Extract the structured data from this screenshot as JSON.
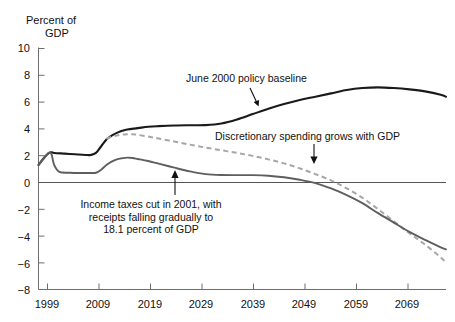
{
  "chart_data": {
    "type": "line",
    "title": "",
    "xlabel": "",
    "ylabel": "Percent of GDP",
    "ylabel_line1": "Percent of",
    "ylabel_line2": "GDP",
    "xlim": [
      1997,
      2075
    ],
    "ylim": [
      -8,
      10
    ],
    "grid": false,
    "legend": "none (inline annotations with arrows)",
    "ytick_labels": [
      "10",
      "8",
      "6",
      "4",
      "2",
      "0",
      "−2",
      "−4",
      "−6",
      "−8"
    ],
    "ytick_values": [
      10,
      8,
      6,
      4,
      2,
      0,
      -2,
      -4,
      -6,
      -8
    ],
    "xtick_labels": [
      "1999",
      "2009",
      "2019",
      "2029",
      "2039",
      "2049",
      "2059",
      "2069"
    ],
    "xtick_values": [
      1999,
      2009,
      2019,
      2029,
      2039,
      2049,
      2059,
      2069
    ],
    "zero_line": 0,
    "colors": {
      "baseline": "#1a1a1a",
      "tax_cut": "#5e5e5e",
      "discretionary": "#a6a6a6"
    },
    "series": [
      {
        "name": "June 2000 policy baseline",
        "style": "solid",
        "color": "#1a1a1a",
        "x": [
          1997,
          1998,
          1999,
          1999.6,
          2000,
          2002,
          2004,
          2006,
          2007,
          2008,
          2009,
          2010,
          2011,
          2012,
          2013,
          2014,
          2016,
          2018,
          2020,
          2023,
          2026,
          2029,
          2032,
          2035,
          2038,
          2041,
          2044,
          2047,
          2050,
          2053,
          2056,
          2059,
          2062,
          2065,
          2068,
          2071,
          2074,
          2075
        ],
        "y": [
          1.3,
          1.8,
          2.2,
          2.25,
          2.2,
          2.15,
          2.1,
          2.05,
          2.05,
          2.2,
          2.7,
          3.2,
          3.5,
          3.7,
          3.85,
          3.95,
          4.05,
          4.15,
          4.2,
          4.25,
          4.27,
          4.28,
          4.4,
          4.7,
          5.1,
          5.5,
          5.85,
          6.15,
          6.4,
          6.65,
          6.9,
          7.05,
          7.1,
          7.05,
          6.95,
          6.8,
          6.55,
          6.4
        ]
      },
      {
        "name": "Income taxes cut in 2001, with receipts falling gradually to 18.1 percent of GDP",
        "style": "solid",
        "color": "#5e5e5e",
        "x": [
          1997,
          1998,
          1999,
          1999.5,
          2000,
          2001,
          2003,
          2005,
          2007,
          2008,
          2009,
          2010,
          2011,
          2012,
          2013,
          2014,
          2015,
          2016,
          2018,
          2020,
          2023,
          2026,
          2029,
          2032,
          2035,
          2038,
          2041,
          2044,
          2047,
          2050,
          2053,
          2056,
          2059,
          2062,
          2065,
          2068,
          2071,
          2074,
          2075
        ],
        "y": [
          1.3,
          1.8,
          2.2,
          2.1,
          1.3,
          0.78,
          0.72,
          0.7,
          0.7,
          0.72,
          0.95,
          1.3,
          1.55,
          1.72,
          1.8,
          1.85,
          1.82,
          1.75,
          1.6,
          1.4,
          1.1,
          0.82,
          0.62,
          0.55,
          0.54,
          0.54,
          0.5,
          0.38,
          0.2,
          -0.05,
          -0.45,
          -0.95,
          -1.55,
          -2.3,
          -3.0,
          -3.7,
          -4.3,
          -4.85,
          -5.0
        ]
      },
      {
        "name": "Discretionary spending grows with GDP",
        "style": "dashed",
        "color": "#a6a6a6",
        "x": [
          2010,
          2011,
          2012,
          2013,
          2014,
          2015,
          2016,
          2018,
          2020,
          2023,
          2026,
          2029,
          2032,
          2035,
          2038,
          2041,
          2044,
          2047,
          2050,
          2053,
          2056,
          2059,
          2062,
          2065,
          2068,
          2071,
          2074,
          2075
        ],
        "y": [
          3.25,
          3.4,
          3.5,
          3.57,
          3.6,
          3.6,
          3.55,
          3.42,
          3.28,
          3.05,
          2.82,
          2.6,
          2.4,
          2.2,
          1.98,
          1.72,
          1.42,
          1.05,
          0.62,
          0.15,
          -0.45,
          -1.15,
          -2.0,
          -2.9,
          -3.8,
          -4.65,
          -5.6,
          -6.0
        ]
      }
    ],
    "annotations": [
      {
        "id": "baseline",
        "text": "June 2000 policy baseline",
        "target_series": "June 2000 policy baseline",
        "arrow": "down-right"
      },
      {
        "id": "discretionary",
        "text": "Discretionary spending grows with GDP",
        "target_series": "Discretionary spending grows with GDP",
        "arrow": "down"
      },
      {
        "id": "taxcut",
        "text": "Income taxes cut in 2001, with receipts falling gradually to 18.1 percent of GDP",
        "line1": "Income taxes cut in 2001, with",
        "line2": "receipts falling gradually to",
        "line3": "18.1 percent of GDP",
        "target_series": "Income taxes cut in 2001, with receipts falling gradually to 18.1 percent of GDP",
        "arrow": "up"
      }
    ]
  }
}
